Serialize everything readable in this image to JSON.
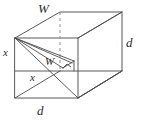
{
  "figure": {
    "kind": "geometry-diagram",
    "stroke_color": "#58595b",
    "hidden_stroke_color": "#8d8f92",
    "diagonal_color": "#4a4b4d",
    "background_color": "#ffffff",
    "labels": {
      "width_top": "W",
      "depth_right": "d",
      "depth_bottom": "d",
      "height_left": "x",
      "height_mid": "x",
      "width_inner": "W"
    },
    "vertices": {
      "front_top_left": "15,38",
      "front_top_right": "78,38",
      "front_bottom_left": "15,98",
      "front_bottom_right": "78,98",
      "back_top_left": "60,12",
      "back_top_right": "122,12",
      "back_bottom_left": "60,71",
      "back_bottom_right": "122,71"
    }
  }
}
